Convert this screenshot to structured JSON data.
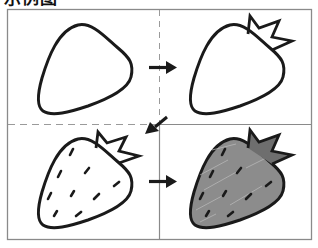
{
  "title": "示例图",
  "figure": {
    "steps": [
      {
        "index": 1,
        "label": "outline",
        "position": "top-left"
      },
      {
        "index": 2,
        "label": "add leaves",
        "position": "top-right"
      },
      {
        "index": 3,
        "label": "add seeds",
        "position": "bottom-left"
      },
      {
        "index": 4,
        "label": "color in",
        "position": "bottom-right"
      }
    ],
    "arrows": [
      {
        "from": 1,
        "to": 2,
        "direction": "right"
      },
      {
        "from": 2,
        "to": 3,
        "direction": "down-left"
      },
      {
        "from": 3,
        "to": 4,
        "direction": "right"
      }
    ],
    "colors": {
      "outline": "#1a1a1a",
      "frame": "#8a8a8a",
      "fill": "#8c8c8c",
      "leaf_fill": "#6e6e6e"
    }
  }
}
